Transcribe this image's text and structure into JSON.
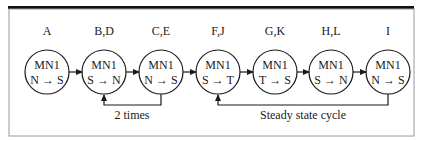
{
  "diagram": {
    "nodes": [
      {
        "id": "A",
        "label": "A",
        "title": "MN1",
        "transition": "N → S",
        "cx": 47
      },
      {
        "id": "BD",
        "label": "B,D",
        "title": "MN1",
        "transition": "S → N",
        "cx": 104
      },
      {
        "id": "CE",
        "label": "C,E",
        "title": "MN1",
        "transition": "N → S",
        "cx": 161
      },
      {
        "id": "FJ",
        "label": "F,J",
        "title": "MN1",
        "transition": "S → T",
        "cx": 218
      },
      {
        "id": "GK",
        "label": "G,K",
        "title": "MN1",
        "transition": "T → S",
        "cx": 275
      },
      {
        "id": "HL",
        "label": "H,L",
        "title": "MN1",
        "transition": "S → N",
        "cx": 331
      },
      {
        "id": "I",
        "label": "I",
        "title": "MN1",
        "transition": "N → S",
        "cx": 388
      }
    ],
    "loops": [
      {
        "from": "CE",
        "to": "BD",
        "label": "2 times"
      },
      {
        "from": "I",
        "to": "FJ",
        "label": "Steady state cycle"
      }
    ]
  }
}
